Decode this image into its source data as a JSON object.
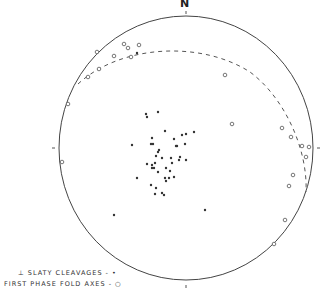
{
  "diagram": {
    "type": "stereonet",
    "north_label": "N",
    "circle": {
      "cx": 186,
      "cy": 148,
      "rx": 127,
      "ry": 132,
      "stroke": "#444444"
    },
    "ticks": [
      {
        "x1": 186,
        "y1": 11,
        "x2": 186,
        "y2": 14
      },
      {
        "x1": 52,
        "y1": 148,
        "x2": 55,
        "y2": 148
      },
      {
        "x1": 317,
        "y1": 148,
        "x2": 320,
        "y2": 148
      },
      {
        "x1": 186,
        "y1": 285,
        "x2": 186,
        "y2": 288
      }
    ],
    "great_circle_path": "M 78 84 C 120 45, 200 40, 250 72 C 285 98, 308 150, 306 192",
    "legend": [
      {
        "symbol": "⊥",
        "label": "SLATY CLEAVAGES - •"
      },
      {
        "symbol": "",
        "label": "FIRST PHASE FOLD AXES - ○"
      }
    ],
    "series": {
      "slaty_cleavages_poles": [
        [
          146,
          114
        ],
        [
          147,
          117
        ],
        [
          158,
          112
        ],
        [
          165,
          131
        ],
        [
          152,
          138
        ],
        [
          153,
          144
        ],
        [
          132,
          145
        ],
        [
          182,
          135
        ],
        [
          186,
          134
        ],
        [
          194,
          132
        ],
        [
          174,
          139
        ],
        [
          185,
          144
        ],
        [
          177,
          146
        ],
        [
          151,
          144
        ],
        [
          159,
          150
        ],
        [
          158,
          152
        ],
        [
          176,
          146
        ],
        [
          162,
          158
        ],
        [
          156,
          156
        ],
        [
          171,
          158
        ],
        [
          180,
          157
        ],
        [
          179,
          160
        ],
        [
          172,
          163
        ],
        [
          186,
          160
        ],
        [
          147,
          164
        ],
        [
          155,
          163
        ],
        [
          152,
          165
        ],
        [
          152,
          168
        ],
        [
          154,
          168
        ],
        [
          166,
          168
        ],
        [
          158,
          172
        ],
        [
          170,
          171
        ],
        [
          137,
          178
        ],
        [
          165,
          178
        ],
        [
          166,
          181
        ],
        [
          169,
          178
        ],
        [
          174,
          177
        ],
        [
          151,
          185
        ],
        [
          156,
          188
        ],
        [
          162,
          193
        ],
        [
          164,
          195
        ],
        [
          155,
          194
        ],
        [
          114,
          215
        ],
        [
          205,
          210
        ],
        [
          137,
          53
        ]
      ],
      "first_phase_fold_axes": [
        [
          97,
          52
        ],
        [
          124,
          44
        ],
        [
          128,
          48
        ],
        [
          139,
          45
        ],
        [
          114,
          56
        ],
        [
          131,
          57
        ],
        [
          99,
          69
        ],
        [
          88,
          77
        ],
        [
          68,
          104
        ],
        [
          62,
          162
        ],
        [
          225,
          75
        ],
        [
          232,
          124
        ],
        [
          282,
          128
        ],
        [
          291,
          137
        ],
        [
          302,
          146
        ],
        [
          309,
          147
        ],
        [
          306,
          157
        ],
        [
          293,
          175
        ],
        [
          289,
          186
        ],
        [
          285,
          220
        ],
        [
          274,
          244
        ]
      ]
    }
  }
}
